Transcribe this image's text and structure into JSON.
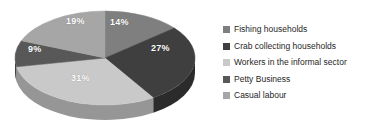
{
  "chart_data": {
    "type": "pie",
    "title": "",
    "subtitle": "",
    "xlabel": "",
    "ylabel": "",
    "legend_position": "right",
    "grid": false,
    "categories": [
      "Fishing households",
      "Crab collecting households",
      "Workers in the informal sector",
      "Petty Business",
      "Casual labour"
    ],
    "values": [
      14,
      27,
      31,
      9,
      19
    ],
    "value_suffix": "%",
    "data_labels": [
      "14%",
      "27%",
      "31%",
      "9%",
      "19%"
    ],
    "slice_colors": [
      "#7f7f7f",
      "#3f3f3f",
      "#c9c9c9",
      "#585858",
      "#a6a6a6"
    ],
    "side_colors": [
      "#5e5e5e",
      "#2b2b2b",
      "#969696",
      "#3f3f3f",
      "#7c7c7c"
    ],
    "background_color": "#ffffff",
    "label_text_color": "#ffffff"
  },
  "legend": {
    "items": [
      {
        "label": "Fishing households",
        "color": "#7f7f7f",
        "swatch_icon": "square-swatch-icon"
      },
      {
        "label": "Crab collecting households",
        "color": "#3f3f3f",
        "swatch_icon": "square-swatch-icon"
      },
      {
        "label": "Workers in the informal sector",
        "color": "#c9c9c9",
        "swatch_icon": "square-swatch-icon"
      },
      {
        "label": "Petty Business",
        "color": "#585858",
        "swatch_icon": "square-swatch-icon"
      },
      {
        "label": "Casual labour",
        "color": "#a6a6a6",
        "swatch_icon": "square-swatch-icon"
      }
    ]
  }
}
